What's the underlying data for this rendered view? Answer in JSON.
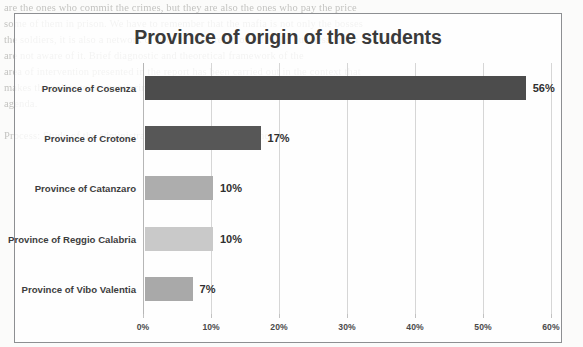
{
  "document_background": {
    "note": "faint bleed-through text from the scanned page behind the figure",
    "lines": [
      "are the ones who commit the crimes, but they are also the ones who pay the price",
      "some of them in prison. We have to remember that the mafia is not only the bosses",
      "the soldiers, it is also a network of people who are involved in the business, often",
      "are not aware of it. Brief diagnostic and theoretical framework of the",
      "area of intervention presented in the report has been carried out in the context that",
      "makes the police to be monitoring and stimulating the fighting against a broader",
      "agenda.",
      "  ",
      "Process: Study of the administrative processes of the province",
      " ",
      " ",
      " ",
      " ",
      " ",
      " ",
      " ",
      " ",
      " ",
      " ",
      " ",
      " ",
      " "
    ]
  },
  "chart_data": {
    "type": "bar",
    "orientation": "horizontal",
    "title": "Province of origin of the students",
    "xlabel": "",
    "ylabel": "",
    "categories": [
      "Province of Cosenza",
      "Province of Crotone",
      "Province of Catanzaro",
      "Province of Reggio Calabria",
      "Province of Vibo Valentia"
    ],
    "values": [
      56,
      17,
      10,
      10,
      7
    ],
    "value_labels": [
      "56%",
      "17%",
      "10%",
      "10%",
      "7%"
    ],
    "bar_colors": [
      "#4c4c4c",
      "#575757",
      "#adadad",
      "#c9c9c9",
      "#a9a9a9"
    ],
    "xlim": [
      0,
      60
    ],
    "x_ticks": [
      0,
      10,
      20,
      30,
      40,
      50,
      60
    ],
    "x_tick_labels": [
      "0%",
      "10%",
      "20%",
      "30%",
      "40%",
      "50%",
      "60%"
    ],
    "grid": "vertical",
    "legend": "none"
  }
}
